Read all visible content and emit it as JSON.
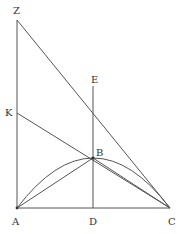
{
  "diagram": {
    "type": "geometric-construction",
    "points": {
      "Z": {
        "label": "Z",
        "x": 17,
        "y": 20
      },
      "K": {
        "label": "K",
        "x": 17,
        "y": 113
      },
      "A": {
        "label": "A",
        "x": 17,
        "y": 208
      },
      "D": {
        "label": "D",
        "x": 93,
        "y": 208
      },
      "C": {
        "label": "C",
        "x": 170,
        "y": 208
      },
      "E": {
        "label": "E",
        "x": 93,
        "y": 113
      },
      "B": {
        "label": "B",
        "x": 93,
        "y": 158
      }
    },
    "segments": [
      [
        "Z",
        "A"
      ],
      [
        "A",
        "C"
      ],
      [
        "Z",
        "C"
      ],
      [
        "K",
        "C"
      ],
      [
        "E",
        "D"
      ],
      [
        "A",
        "B"
      ],
      [
        "B",
        "C"
      ]
    ],
    "arcs": [
      {
        "from": "A",
        "through": "B",
        "to": "C"
      }
    ],
    "line_color": "#555555",
    "label_color": "#333333"
  }
}
